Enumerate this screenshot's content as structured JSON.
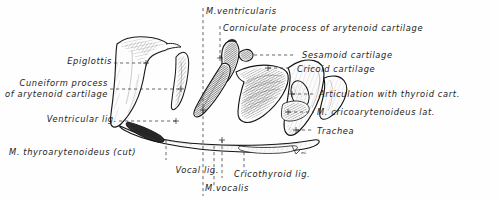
{
  "figure": {
    "background_color": "#fefefe",
    "ink_color": "#1b1b1b",
    "leader_color": "#444444",
    "artist_mark": "mL"
  },
  "labels": {
    "epiglottis": "Epiglottis",
    "cuneiform_line1": "Cuneiform process",
    "cuneiform_line2": "of arytenoid cartilage",
    "ventricular_lig": "Ventricular lig.",
    "thyroarytenoideus": "M. thyroarytenoideus (cut)",
    "vocal_lig": "Vocal lig.",
    "m_vocalis": "M.vocalis",
    "cricothyroid_lig": "Cricothyroid lig.",
    "m_ventricularis": "M.ventricularis",
    "corniculate": "Corniculate process of arytenoid cartilage",
    "sesamoid": "Sesamoid cartilage",
    "cricoid": "Cricoid cartilage",
    "articulation": "Articulation with thyroid cart.",
    "cricoarytenoideus": "M. cricoarytenoideus lat.",
    "trachea": "Trachea"
  }
}
